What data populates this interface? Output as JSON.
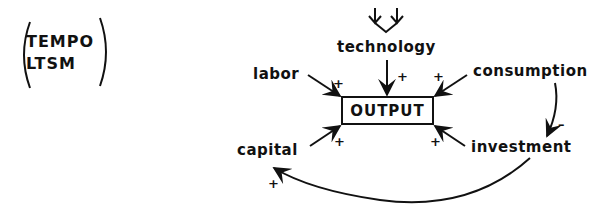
{
  "model": {
    "lines": [
      "TEMPO",
      "LTSM"
    ]
  },
  "nodes": {
    "technology": "technology",
    "labor": "labor",
    "consumption": "consumption",
    "output": "OUTPUT",
    "capital": "capital",
    "investment": "investment"
  },
  "edges": [
    {
      "from": "external",
      "to": "technology",
      "sign": ""
    },
    {
      "from": "technology",
      "to": "OUTPUT",
      "sign": "+"
    },
    {
      "from": "labor",
      "to": "OUTPUT",
      "sign": "+"
    },
    {
      "from": "consumption",
      "to": "OUTPUT",
      "sign": "+"
    },
    {
      "from": "capital",
      "to": "OUTPUT",
      "sign": "+"
    },
    {
      "from": "investment",
      "to": "OUTPUT",
      "sign": "+"
    },
    {
      "from": "consumption",
      "to": "investment",
      "sign": "-"
    },
    {
      "from": "investment",
      "to": "capital",
      "sign": "+"
    }
  ],
  "signs": {
    "labor_output": "+",
    "technology_output": "+",
    "consumption_output": "+",
    "capital_output": "+",
    "investment_output": "+",
    "consumption_investment": "–",
    "investment_capital": "+"
  },
  "colors": {
    "ink": "#111111",
    "background": "#ffffff"
  }
}
